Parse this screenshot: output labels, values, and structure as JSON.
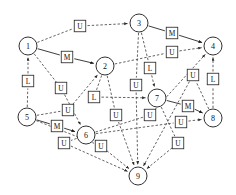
{
  "diagram": {
    "type": "directed-graph",
    "title": "",
    "background_color": "#ffffff",
    "node_shape": "circle",
    "node_fill": "#ffffff",
    "node_stroke": "#1a1a1a",
    "label_box_shape": "square",
    "edge_styles": {
      "solid": "M-labeled edges drawn as solid arrows",
      "dashed": "U-labeled and L-labeled edges drawn as dashed arrows"
    },
    "nodes": [
      {
        "id": "1",
        "label": "1",
        "x": 28,
        "y": 46,
        "r": 9
      },
      {
        "id": "2",
        "label": "2",
        "x": 105,
        "y": 66,
        "r": 9
      },
      {
        "id": "3",
        "label": "3",
        "x": 139,
        "y": 23,
        "r": 9
      },
      {
        "id": "4",
        "label": "4",
        "x": 213,
        "y": 46,
        "r": 9
      },
      {
        "id": "5",
        "label": "5",
        "x": 27,
        "y": 117,
        "r": 9
      },
      {
        "id": "6",
        "label": "6",
        "x": 86,
        "y": 135,
        "r": 9
      },
      {
        "id": "7",
        "label": "7",
        "x": 157,
        "y": 98,
        "r": 9
      },
      {
        "id": "8",
        "label": "8",
        "x": 213,
        "y": 118,
        "r": 9
      },
      {
        "id": "9",
        "label": "9",
        "x": 138,
        "y": 176,
        "r": 9
      }
    ],
    "edge_labels": [
      {
        "text": "U",
        "x": 80,
        "y": 26
      },
      {
        "text": "M",
        "x": 67,
        "y": 57
      },
      {
        "text": "M",
        "x": 172,
        "y": 33
      },
      {
        "text": "U",
        "x": 172,
        "y": 52
      },
      {
        "text": "L",
        "x": 28,
        "y": 81
      },
      {
        "text": "U",
        "x": 61,
        "y": 88
      },
      {
        "text": "L",
        "x": 150,
        "y": 68
      },
      {
        "text": "U",
        "x": 136,
        "y": 85
      },
      {
        "text": "U",
        "x": 193,
        "y": 75
      },
      {
        "text": "L",
        "x": 213,
        "y": 79
      },
      {
        "text": "L",
        "x": 94,
        "y": 97
      },
      {
        "text": "U",
        "x": 68,
        "y": 110
      },
      {
        "text": "U",
        "x": 116,
        "y": 115
      },
      {
        "text": "U",
        "x": 150,
        "y": 115
      },
      {
        "text": "M",
        "x": 188,
        "y": 106
      },
      {
        "text": "U",
        "x": 181,
        "y": 122
      },
      {
        "text": "M",
        "x": 57,
        "y": 126
      },
      {
        "text": "U",
        "x": 64,
        "y": 143
      },
      {
        "text": "U",
        "x": 101,
        "y": 146
      },
      {
        "text": "U",
        "x": 178,
        "y": 143
      }
    ],
    "edges": [
      {
        "from": "1",
        "to": "3",
        "label": "U",
        "style": "dashed"
      },
      {
        "from": "1",
        "to": "2",
        "label": "M",
        "style": "solid"
      },
      {
        "from": "3",
        "to": "4",
        "label": "M",
        "style": "solid"
      },
      {
        "from": "2",
        "to": "4",
        "label": "U",
        "style": "dashed"
      },
      {
        "from": "5",
        "to": "1",
        "label": "L",
        "style": "dashed"
      },
      {
        "from": "1",
        "to": "6",
        "label": "U",
        "style": "dashed"
      },
      {
        "from": "3",
        "to": "7",
        "label": "L",
        "style": "dashed"
      },
      {
        "from": "3",
        "to": "9",
        "label": "U",
        "style": "dashed"
      },
      {
        "from": "8",
        "to": "4",
        "label": "L",
        "style": "dashed"
      },
      {
        "from": "6",
        "to": "4",
        "label": "U",
        "style": "dashed"
      },
      {
        "from": "2",
        "to": "7",
        "label": "L",
        "style": "dashed"
      },
      {
        "from": "5",
        "to": "2",
        "label": "U",
        "style": "dashed"
      },
      {
        "from": "2",
        "to": "9",
        "label": "U",
        "style": "dashed"
      },
      {
        "from": "7",
        "to": "9",
        "label": "U",
        "style": "dashed"
      },
      {
        "from": "7",
        "to": "8",
        "label": "M",
        "style": "solid"
      },
      {
        "from": "6",
        "to": "8",
        "label": "U",
        "style": "dashed"
      },
      {
        "from": "5",
        "to": "6",
        "label": "M",
        "style": "solid"
      },
      {
        "from": "5",
        "to": "9",
        "label": "U",
        "style": "dashed"
      },
      {
        "from": "6",
        "to": "9",
        "label": "U",
        "style": "dashed"
      },
      {
        "from": "8",
        "to": "9",
        "label": "U",
        "style": "dashed"
      }
    ]
  }
}
